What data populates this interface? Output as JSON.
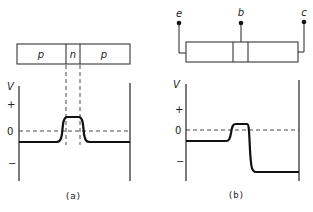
{
  "panel_a": {
    "regions": [
      "p",
      "n",
      "p"
    ],
    "axis_label": "V",
    "tick_plus": "+",
    "tick_zero": "0",
    "tick_minus": "−",
    "caption": "(a)"
  },
  "panel_b": {
    "terminals": [
      "e",
      "b",
      "c"
    ],
    "axis_label": "V",
    "tick_plus": "+",
    "tick_zero": "0",
    "tick_minus": "−",
    "caption": "(b)"
  }
}
